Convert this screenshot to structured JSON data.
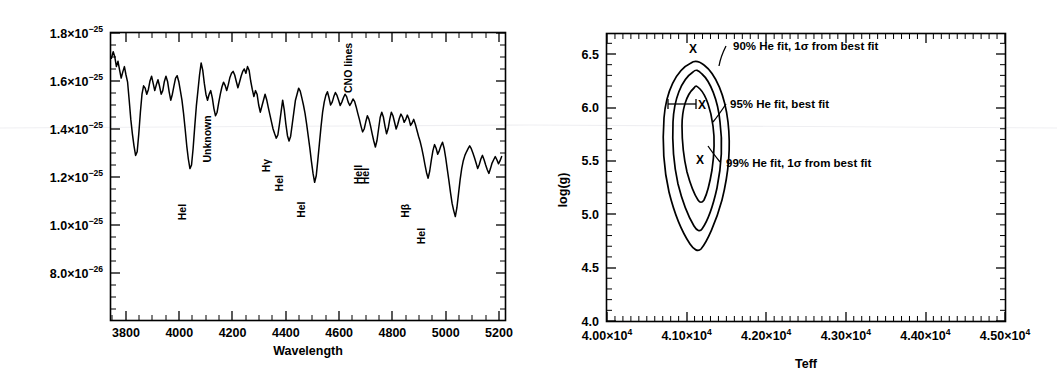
{
  "figure": {
    "title": "",
    "panel_count": 2
  },
  "chart_data": [
    {
      "type": "line",
      "panel": "left",
      "title": "",
      "xlabel": "Wavelength",
      "ylabel": "",
      "xlim": [
        3740,
        5220
      ],
      "ylim": [
        7e-26,
        1.8e-25
      ],
      "grid": false,
      "legend": "none",
      "xticks": [
        3800,
        4000,
        4200,
        4400,
        4600,
        4800,
        5000,
        5200
      ],
      "xtick_labels": [
        "3800",
        "4000",
        "4200",
        "4400",
        "4600",
        "4800",
        "5000",
        "5200"
      ],
      "yticks": [
        1.8e-25,
        1.6e-25,
        1.4e-25,
        1.2e-25,
        1e-25,
        8e-26
      ],
      "ytick_labels": [
        {
          "mant": "1.8×10",
          "exp": "−25"
        },
        {
          "mant": "1.6×10",
          "exp": "−25"
        },
        {
          "mant": "1.4×10",
          "exp": "−25"
        },
        {
          "mant": "1.2×10",
          "exp": "−25"
        },
        {
          "mant": "1.0×10",
          "exp": "−25"
        },
        {
          "mant": "8.0×10",
          "exp": "−26"
        }
      ],
      "annotations": [
        {
          "text": "HeI",
          "wavelength": 4026,
          "y": 1.02e-25,
          "rotation": -90
        },
        {
          "text": "Unknown",
          "wavelength": 4120,
          "y": 1.26e-25,
          "rotation": -90
        },
        {
          "text": "Hγ",
          "wavelength": 4340,
          "y": 1.22e-25,
          "rotation": -90
        },
        {
          "text": "HeI",
          "wavelength": 4388,
          "y": 1.14e-25,
          "rotation": -90
        },
        {
          "text": "HeI",
          "wavelength": 4471,
          "y": 1.03e-25,
          "rotation": -90
        },
        {
          "text": "CNO lines",
          "wavelength": 4650,
          "y": 1.55e-25,
          "rotation": -90
        },
        {
          "text": "HeII",
          "wavelength": 4686,
          "y": 1.17e-25,
          "rotation": -90
        },
        {
          "text": "HeI",
          "wavelength": 4713,
          "y": 1.17e-25,
          "rotation": -90
        },
        {
          "text": "Hβ",
          "wavelength": 4861,
          "y": 1.03e-25,
          "rotation": -90
        },
        {
          "text": "HeI",
          "wavelength": 4922,
          "y": 9.2e-26,
          "rotation": -90
        }
      ],
      "series_description": "Observed optical spectrum, flux versus wavelength, showing absorption lines",
      "x": [
        3745,
        3752,
        3758,
        3764,
        3770,
        3776,
        3782,
        3788,
        3794,
        3800,
        3806,
        3812,
        3818,
        3824,
        3830,
        3836,
        3842,
        3848,
        3854,
        3860,
        3866,
        3872,
        3878,
        3884,
        3890,
        3896,
        3902,
        3908,
        3914,
        3920,
        3926,
        3932,
        3938,
        3944,
        3950,
        3956,
        3962,
        3968,
        3974,
        3980,
        3986,
        3992,
        3998,
        4004,
        4010,
        4016,
        4022,
        4028,
        4034,
        4040,
        4046,
        4052,
        4058,
        4064,
        4070,
        4076,
        4082,
        4088,
        4094,
        4100,
        4106,
        4112,
        4118,
        4124,
        4130,
        4136,
        4142,
        4148,
        4154,
        4160,
        4166,
        4172,
        4178,
        4184,
        4190,
        4196,
        4202,
        4208,
        4214,
        4220,
        4226,
        4232,
        4238,
        4244,
        4250,
        4256,
        4262,
        4268,
        4274,
        4280,
        4286,
        4292,
        4298,
        4304,
        4310,
        4316,
        4322,
        4328,
        4334,
        4340,
        4346,
        4352,
        4358,
        4364,
        4370,
        4376,
        4382,
        4388,
        4394,
        4400,
        4406,
        4412,
        4418,
        4424,
        4430,
        4436,
        4442,
        4448,
        4454,
        4460,
        4466,
        4472,
        4478,
        4484,
        4490,
        4496,
        4502,
        4508,
        4514,
        4520,
        4526,
        4532,
        4538,
        4544,
        4550,
        4556,
        4562,
        4568,
        4574,
        4580,
        4586,
        4592,
        4598,
        4604,
        4610,
        4616,
        4622,
        4628,
        4634,
        4640,
        4646,
        4652,
        4658,
        4664,
        4670,
        4676,
        4682,
        4688,
        4694,
        4700,
        4706,
        4712,
        4718,
        4724,
        4730,
        4736,
        4742,
        4748,
        4754,
        4760,
        4766,
        4772,
        4778,
        4784,
        4790,
        4796,
        4802,
        4808,
        4814,
        4820,
        4826,
        4832,
        4838,
        4844,
        4850,
        4856,
        4862,
        4868,
        4874,
        4880,
        4886,
        4892,
        4898,
        4904,
        4910,
        4916,
        4922,
        4928,
        4934,
        4940,
        4946,
        4952,
        4958,
        4964,
        4970,
        4976,
        4982,
        4988,
        4994,
        5000,
        5006,
        5012,
        5018,
        5024,
        5030,
        5036,
        5042,
        5048,
        5054,
        5060,
        5066,
        5072,
        5078,
        5084,
        5090,
        5096,
        5102,
        5108,
        5114,
        5120,
        5126,
        5132,
        5138,
        5144,
        5150,
        5156,
        5162,
        5168,
        5174,
        5180,
        5186,
        5192,
        5198,
        5204,
        5210
      ],
      "y": [
        1.695,
        1.722,
        1.7,
        1.66,
        1.682,
        1.645,
        1.612,
        1.638,
        1.66,
        1.625,
        1.595,
        1.52,
        1.44,
        1.38,
        1.33,
        1.29,
        1.305,
        1.38,
        1.47,
        1.545,
        1.58,
        1.57,
        1.545,
        1.565,
        1.6,
        1.62,
        1.59,
        1.56,
        1.585,
        1.605,
        1.578,
        1.545,
        1.56,
        1.598,
        1.62,
        1.598,
        1.555,
        1.52,
        1.545,
        1.58,
        1.612,
        1.622,
        1.598,
        1.56,
        1.52,
        1.465,
        1.4,
        1.33,
        1.275,
        1.235,
        1.25,
        1.32,
        1.41,
        1.495,
        1.56,
        1.625,
        1.675,
        1.645,
        1.59,
        1.545,
        1.52,
        1.545,
        1.56,
        1.53,
        1.485,
        1.455,
        1.47,
        1.51,
        1.545,
        1.575,
        1.595,
        1.582,
        1.56,
        1.585,
        1.615,
        1.632,
        1.64,
        1.625,
        1.598,
        1.572,
        1.595,
        1.62,
        1.64,
        1.65,
        1.632,
        1.66,
        1.645,
        1.6,
        1.565,
        1.535,
        1.56,
        1.545,
        1.5,
        1.47,
        1.495,
        1.52,
        1.545,
        1.522,
        1.49,
        1.46,
        1.43,
        1.4,
        1.38,
        1.362,
        1.375,
        1.42,
        1.47,
        1.52,
        1.48,
        1.42,
        1.372,
        1.35,
        1.37,
        1.42,
        1.47,
        1.52,
        1.545,
        1.57,
        1.558,
        1.53,
        1.5,
        1.465,
        1.42,
        1.37,
        1.32,
        1.265,
        1.215,
        1.178,
        1.205,
        1.27,
        1.34,
        1.41,
        1.47,
        1.512,
        1.54,
        1.555,
        1.53,
        1.5,
        1.512,
        1.535,
        1.552,
        1.54,
        1.52,
        1.498,
        1.512,
        1.53,
        1.545,
        1.535,
        1.512,
        1.498,
        1.51,
        1.525,
        1.515,
        1.492,
        1.465,
        1.44,
        1.412,
        1.388,
        1.4,
        1.43,
        1.455,
        1.44,
        1.412,
        1.38,
        1.35,
        1.325,
        1.352,
        1.4,
        1.448,
        1.47,
        1.45,
        1.412,
        1.38,
        1.402,
        1.44,
        1.47,
        1.455,
        1.428,
        1.4,
        1.42,
        1.445,
        1.462,
        1.45,
        1.428,
        1.44,
        1.458,
        1.442,
        1.415,
        1.425,
        1.44,
        1.42,
        1.395,
        1.37,
        1.348,
        1.32,
        1.288,
        1.252,
        1.218,
        1.195,
        1.225,
        1.27,
        1.31,
        1.335,
        1.32,
        1.295,
        1.31,
        1.33,
        1.345,
        1.32,
        1.28,
        1.232,
        1.185,
        1.135,
        1.09,
        1.06,
        1.035,
        1.072,
        1.13,
        1.188,
        1.235,
        1.268,
        1.29,
        1.305,
        1.318,
        1.33,
        1.318,
        1.3,
        1.28,
        1.258,
        1.235,
        1.252,
        1.275,
        1.29,
        1.272,
        1.25,
        1.23,
        1.215,
        1.235,
        1.258,
        1.272,
        1.285,
        1.272,
        1.255,
        1.268,
        1.285,
        1.3,
        1.288,
        1.268,
        1.25,
        1.262,
        1.278,
        1.29,
        1.275,
        1.258,
        1.24,
        1.25,
        1.265,
        1.255,
        1.24,
        1.228,
        1.245,
        1.258
      ],
      "y_units": "1e-25"
    },
    {
      "type": "line",
      "panel": "right",
      "title": "",
      "xlabel": "Teff",
      "ylabel": "log(g)",
      "xlim": [
        40000,
        45000
      ],
      "ylim": [
        4.0,
        6.7
      ],
      "grid": false,
      "legend": "inline-annotations",
      "xticks": [
        40000,
        41000,
        42000,
        43000,
        44000,
        45000
      ],
      "xtick_labels": [
        {
          "mant": "4.00×10",
          "exp": "4"
        },
        {
          "mant": "4.10×10",
          "exp": "4"
        },
        {
          "mant": "4.20×10",
          "exp": "4"
        },
        {
          "mant": "4.30×10",
          "exp": "4"
        },
        {
          "mant": "4.40×10",
          "exp": "4"
        },
        {
          "mant": "4.50×10",
          "exp": "4"
        }
      ],
      "yticks": [
        4.0,
        4.5,
        5.0,
        5.5,
        6.0,
        6.5
      ],
      "ytick_labels": [
        "4.0",
        "4.5",
        "5.0",
        "5.5",
        "6.0",
        "6.5"
      ],
      "contours": [
        {
          "level": "90%",
          "label": "90% He fit, 1σ from best fit",
          "marker": "X",
          "marker_teff": 41000,
          "marker_logg": 6.48
        },
        {
          "level": "95%",
          "label": "95% He fit, best fit",
          "marker": "X",
          "marker_teff": 41060,
          "marker_logg": 6.05
        },
        {
          "level": "99%",
          "label": "99% He fit, 1σ from best fit",
          "marker": "X",
          "marker_teff": 41030,
          "marker_logg": 5.52
        }
      ],
      "annotations": [
        {
          "text": "90% He fit, 1σ from best fit",
          "teff": 41200,
          "logg": 6.53
        },
        {
          "text": "95% He fit, best fit",
          "teff": 41580,
          "logg": 6.03
        },
        {
          "text": "99% He fit, 1σ from best fit",
          "teff": 41320,
          "logg": 5.52
        }
      ],
      "best_fit": {
        "teff": 41060,
        "logg": 6.05
      },
      "error_bar": {
        "teff_low": 40800,
        "teff_high": 41100,
        "logg": 6.05
      }
    }
  ]
}
